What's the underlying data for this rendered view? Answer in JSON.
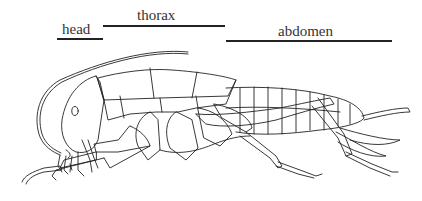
{
  "diagram": {
    "type": "insect-lateral-anatomy",
    "labels": {
      "head": "head",
      "thorax": "thorax",
      "abdomen": "abdomen"
    },
    "colors": {
      "line": "#222222",
      "background": "#ffffff",
      "text": "#333333"
    }
  }
}
